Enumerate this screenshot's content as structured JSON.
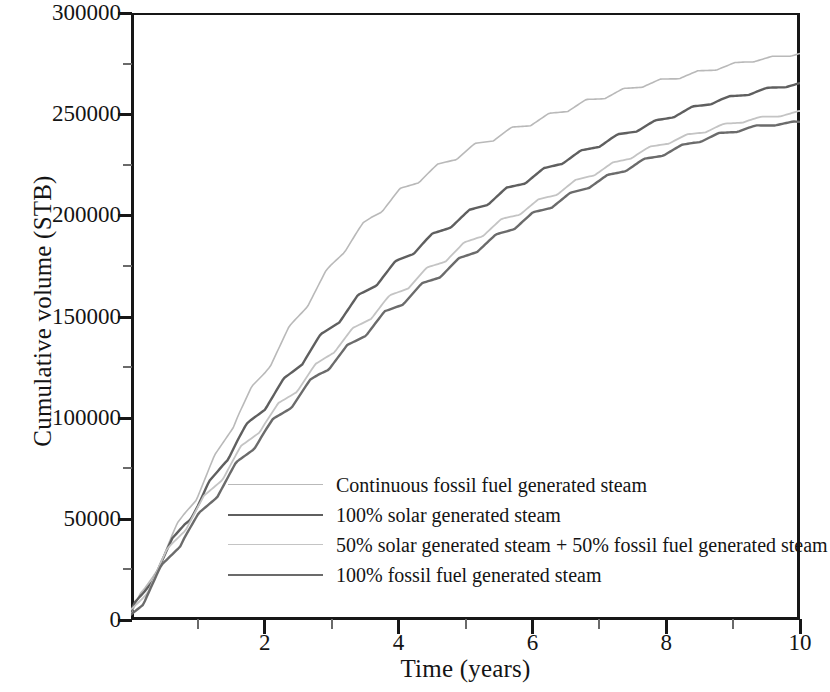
{
  "chart_data": {
    "type": "line",
    "title": "",
    "xlabel": "Time (years)",
    "ylabel": "Cumulative volume (STB)",
    "xlim": [
      0,
      10
    ],
    "ylim": [
      0,
      300000
    ],
    "grid": false,
    "legend_position": "lower-center-inside",
    "xticks": [
      2,
      4,
      6,
      8,
      10
    ],
    "xtick_labels": [
      "2",
      "4",
      "6",
      "8",
      "10"
    ],
    "xticks_minor": [
      1,
      3,
      5,
      7,
      9
    ],
    "yticks": [
      0,
      50000,
      100000,
      150000,
      200000,
      250000,
      300000
    ],
    "ytick_labels": [
      "0",
      "50000",
      "100000",
      "150000",
      "200000",
      "250000",
      "300000"
    ],
    "yticks_minor": [
      25000,
      75000,
      125000,
      175000,
      225000,
      275000
    ],
    "x": [
      0,
      0.2,
      0.4,
      0.6,
      0.8,
      1.0,
      1.2,
      1.4,
      1.6,
      1.8,
      2.0,
      2.2,
      2.4,
      2.6,
      2.8,
      3.0,
      3.2,
      3.4,
      3.6,
      3.8,
      4.0,
      4.4,
      4.8,
      5.2,
      5.6,
      6.0,
      6.4,
      6.8,
      7.2,
      7.6,
      8.0,
      8.4,
      8.8,
      9.2,
      9.6,
      10.0
    ],
    "series": [
      {
        "name": "Continuous fossil fuel generated steam",
        "color": "#b9b9b9",
        "width": 1.6,
        "values": [
          3000,
          14000,
          27000,
          40000,
          52000,
          63000,
          76000,
          89000,
          102000,
          113000,
          123000,
          134000,
          145000,
          155000,
          165000,
          175000,
          184000,
          192000,
          199000,
          205000,
          211000,
          220000,
          228000,
          235000,
          241000,
          246000,
          251000,
          256000,
          260000,
          264000,
          267000,
          270000,
          273000,
          276000,
          278000,
          280000
        ]
      },
      {
        "name": "100% solar generated steam",
        "color": "#5f5f5f",
        "width": 2.4,
        "values": [
          3000,
          14000,
          26000,
          37000,
          48000,
          57000,
          68000,
          79000,
          89000,
          98000,
          106000,
          114000,
          122000,
          130000,
          138000,
          145000,
          152000,
          159000,
          165000,
          171000,
          177000,
          187000,
          196000,
          204000,
          212000,
          219000,
          226000,
          232000,
          238000,
          243000,
          248000,
          253000,
          257000,
          260000,
          263000,
          265000
        ]
      },
      {
        "name": "50%  solar generated steam + 50% fossil fuel generated steam",
        "color": "#c4c4c4",
        "width": 1.8,
        "values": [
          3000,
          13000,
          25000,
          36000,
          46000,
          55000,
          64000,
          73000,
          82000,
          90000,
          98000,
          105000,
          112000,
          119000,
          126000,
          133000,
          139000,
          145000,
          151000,
          157000,
          162000,
          172000,
          181000,
          190000,
          198000,
          205000,
          212000,
          219000,
          225000,
          231000,
          236000,
          240000,
          244000,
          247000,
          249000,
          251000
        ]
      },
      {
        "name": "100% fossil fuel generated steam",
        "color": "#6b6b6b",
        "width": 2.4,
        "values": [
          2000,
          11000,
          22000,
          32000,
          42000,
          50000,
          59000,
          68000,
          77000,
          85000,
          93000,
          100000,
          107000,
          114000,
          121000,
          127000,
          133000,
          139000,
          145000,
          151000,
          156000,
          166000,
          175000,
          184000,
          192000,
          200000,
          207000,
          214000,
          220000,
          226000,
          231000,
          236000,
          240000,
          243000,
          245000,
          246000
        ]
      }
    ]
  },
  "legend": {
    "entries": [
      {
        "label": "Continuous fossil fuel generated steam"
      },
      {
        "label": "100% solar generated steam"
      },
      {
        "label": "50%  solar generated steam + 50% fossil fuel generated steam"
      },
      {
        "label": "100% fossil fuel generated steam"
      }
    ]
  },
  "axes": {
    "x_title": "Time (years)",
    "y_title": "Cumulative volume (STB)"
  }
}
